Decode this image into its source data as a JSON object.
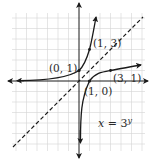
{
  "figure": {
    "type": "function-graph"
  },
  "colors": {
    "grid": "#d4d4d4",
    "axes": "#1a1a1a",
    "curve": "#1a1a1a",
    "dashed_line": "#1a1a1a",
    "text": "#2a2a2a"
  },
  "grid": {
    "unit_px": 10.5,
    "origin_px": [
      79,
      81
    ],
    "x_range": [
      -6,
      6
    ],
    "y_range": [
      -6.5,
      6.5
    ]
  },
  "curves": [
    {
      "name": "exponential",
      "equation": "y = 3^x",
      "points": [
        [
          0,
          1
        ],
        [
          1,
          3
        ]
      ]
    },
    {
      "name": "inverse",
      "equation": "x = 3^y",
      "points": [
        [
          1,
          0
        ],
        [
          3,
          1
        ]
      ]
    },
    {
      "name": "reflection-line",
      "equation": "y = x",
      "style": "dashed"
    }
  ],
  "labels": {
    "point_0_1": "(0, 1)",
    "point_1_3": "(1, 3)",
    "point_1_0": "(1, 0)",
    "point_3_1": "(3, 1)",
    "equation_x": "x",
    "equation_eq": "=",
    "equation_base": "3",
    "equation_exp": "y"
  }
}
